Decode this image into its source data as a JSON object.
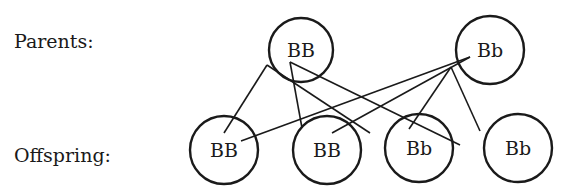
{
  "labels": {
    "parents": "Parents:",
    "offspring": "Offspring:"
  },
  "colors": {
    "stroke": "#1a1a1a",
    "background": "#ffffff"
  },
  "parents": [
    {
      "id": "p1",
      "genotype": "BB",
      "cx": 301,
      "cy": 50,
      "r": 32
    },
    {
      "id": "p2",
      "genotype": "Bb",
      "cx": 490,
      "cy": 50,
      "r": 34
    }
  ],
  "offspring": [
    {
      "id": "o1",
      "genotype": "BB",
      "cx": 224,
      "cy": 150,
      "r": 34
    },
    {
      "id": "o2",
      "genotype": "BB",
      "cx": 327,
      "cy": 150,
      "r": 34
    },
    {
      "id": "o3",
      "genotype": "Bb",
      "cx": 419,
      "cy": 148,
      "r": 34
    },
    {
      "id": "o4",
      "genotype": "Bb",
      "cx": 518,
      "cy": 148,
      "r": 34
    }
  ],
  "connections": [
    {
      "from": "p1",
      "to": "o1",
      "x1": 267,
      "y1": 65,
      "x2": 224,
      "y2": 133
    },
    {
      "from": "p1",
      "to": "o3",
      "x1": 267,
      "y1": 65,
      "x2": 370,
      "y2": 133
    },
    {
      "from": "p1",
      "to": "o2",
      "x1": 290,
      "y1": 62,
      "x2": 302,
      "y2": 128
    },
    {
      "from": "p1",
      "to": "o4",
      "x1": 290,
      "y1": 62,
      "x2": 460,
      "y2": 145
    },
    {
      "from": "p2",
      "to": "o1",
      "x1": 470,
      "y1": 57,
      "x2": 241,
      "y2": 141
    },
    {
      "from": "p2",
      "to": "o2",
      "x1": 470,
      "y1": 57,
      "x2": 332,
      "y2": 133
    },
    {
      "from": "p2",
      "to": "o3",
      "x1": 451,
      "y1": 67,
      "x2": 409,
      "y2": 129
    },
    {
      "from": "p2",
      "to": "o4",
      "x1": 451,
      "y1": 67,
      "x2": 480,
      "y2": 131
    }
  ]
}
